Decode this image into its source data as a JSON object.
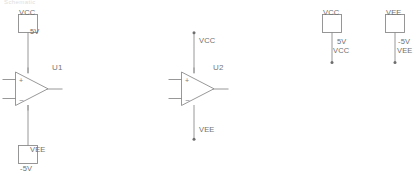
{
  "canvas": {
    "width": 416,
    "height": 181,
    "background": "#ffffff",
    "wire_color": "#8c8c8c",
    "symbol_color": "#8c8c8c",
    "text_color": "#6b6b6b"
  },
  "cropped_header": {
    "text": "Schematic"
  },
  "circuits": [
    {
      "id": "u1-circuit",
      "reference": "U1",
      "top_source": {
        "net_label": "VCC",
        "value": "5V"
      },
      "bottom_source": {
        "net_label": "VEE",
        "value": "-5V"
      },
      "pins": {
        "noninverting": "+",
        "inverting": "-"
      }
    },
    {
      "id": "u2-circuit",
      "reference": "U2",
      "top_net": "VCC",
      "bottom_net": "VEE",
      "pins": {
        "noninverting": "+",
        "inverting": "-"
      }
    }
  ],
  "net_sources": [
    {
      "id": "vcc-net-source",
      "net_label": "VCC",
      "value": "5V",
      "net_name": "VCC"
    },
    {
      "id": "vee-net-source",
      "net_label": "VEE",
      "value": "-5V",
      "net_name": "VEE"
    }
  ]
}
